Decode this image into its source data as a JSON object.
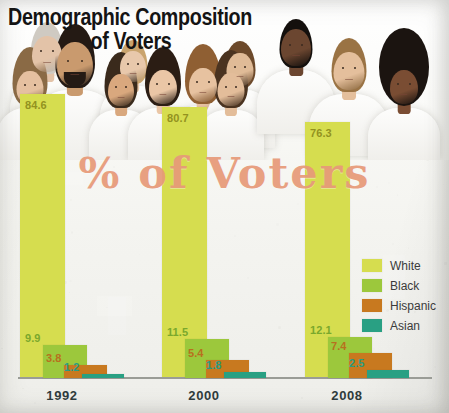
{
  "title": {
    "line1": "Demographic Composition",
    "line2": "of Voters"
  },
  "watermark": "% of Voters",
  "legend": {
    "items": [
      {
        "label": "White",
        "color": "#d6dd4f"
      },
      {
        "label": "Black",
        "color": "#9cc83c"
      },
      {
        "label": "Hispanic",
        "color": "#c8791f"
      },
      {
        "label": "Asian",
        "color": "#29a083"
      }
    ]
  },
  "chart_data": {
    "type": "bar",
    "title": "Demographic Composition of Voters",
    "subtitle": "% of Voters",
    "xlabel": "",
    "ylabel": "% of Voters",
    "ylim": [
      0,
      100
    ],
    "grid": false,
    "legend_position": "right",
    "categories": [
      "1992",
      "2000",
      "2008"
    ],
    "series": [
      {
        "name": "White",
        "color": "#d6dd4f",
        "values": [
          84.6,
          80.7,
          76.3
        ],
        "label_color": "#8a8a20"
      },
      {
        "name": "Black",
        "color": "#9cc83c",
        "values": [
          9.9,
          11.5,
          12.1
        ],
        "label_color": "#7aa82c"
      },
      {
        "name": "Hispanic",
        "color": "#c8791f",
        "values": [
          3.8,
          5.4,
          7.4
        ],
        "label_color": "#b8701e"
      },
      {
        "name": "Asian",
        "color": "#29a083",
        "values": [
          1.2,
          1.8,
          2.5
        ],
        "label_color": "#2a9c82"
      }
    ]
  }
}
